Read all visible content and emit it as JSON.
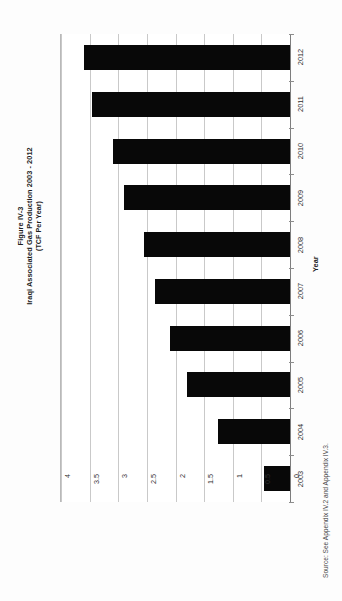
{
  "figure": {
    "title_line1": "Figure IV-3",
    "title_line2": "Iraqi Associated Gas Production  2003 - 2012",
    "title_line3": "(TCF Per Year)",
    "source": "Source: See Appendix IV.2 and Appendix IV.3."
  },
  "colors": {
    "bar": "#080808",
    "gridline": "#c9c9c9",
    "axis": "#8d8d8d",
    "text": "#2e2e2e",
    "background": "#ffffff"
  },
  "chart_data": {
    "type": "bar",
    "orientation": "horizontal",
    "xlabel": "",
    "ylabel": "Year",
    "categories": [
      "2012",
      "2011",
      "2010",
      "2009",
      "2008",
      "2007",
      "2006",
      "2005",
      "2004",
      "2003"
    ],
    "values": [
      3.6,
      3.45,
      3.1,
      2.9,
      2.55,
      2.35,
      2.1,
      1.8,
      1.25,
      0.45
    ],
    "value_unit": "TCF Per Year",
    "xlim": [
      0,
      4
    ],
    "value_ticks": [
      "4",
      "3.5",
      "3",
      "2.5",
      "2",
      "1.5",
      "1",
      "0.5",
      "0"
    ],
    "value_tick_values": [
      4,
      3.5,
      3,
      2.5,
      2,
      1.5,
      1,
      0.5,
      0
    ],
    "tick_interval": 0.5,
    "grid": true,
    "legend": "none",
    "axis_direction": "value axis increases right-to-left; zero at right spine"
  }
}
